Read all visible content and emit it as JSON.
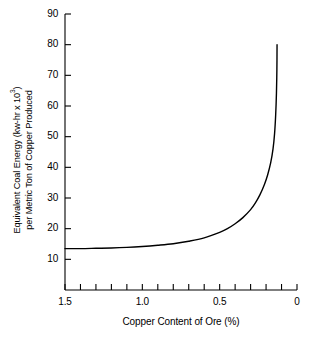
{
  "chart_data": {
    "type": "line",
    "title": "",
    "xlabel": "Copper Content of Ore (%)",
    "ylabel_line1": "Equivalent Coal Energy (kw-hr x 10",
    "ylabel_sup": "3",
    "ylabel_line1_end": ")",
    "ylabel_line2": "per Metric Ton of Copper Produced",
    "xlim": [
      1.5,
      0.0
    ],
    "ylim": [
      0,
      90
    ],
    "x_axis_reversed": true,
    "grid": false,
    "legend": null,
    "y_ticks": [
      90,
      80,
      70,
      60,
      50,
      40,
      30,
      20,
      10
    ],
    "y_tick_labels": [
      "90",
      "80",
      "70",
      "60",
      "50",
      "40",
      "30",
      "20",
      "10"
    ],
    "x_ticks_major": [
      1.5,
      1.0,
      0.5,
      0.0
    ],
    "x_tick_labels_major": [
      "1.5",
      "1.0",
      "0.5",
      "0"
    ],
    "x_ticks_minor": [
      1.4,
      1.3,
      1.2,
      1.1,
      0.9,
      0.8,
      0.7,
      0.6,
      0.4,
      0.3,
      0.2,
      0.1
    ],
    "line_color": "#000000",
    "line_width": 1.4,
    "x": [
      1.5,
      1.4,
      1.3,
      1.2,
      1.1,
      1.0,
      0.9,
      0.8,
      0.7,
      0.6,
      0.5,
      0.45,
      0.4,
      0.35,
      0.3,
      0.27,
      0.24,
      0.21,
      0.19,
      0.17,
      0.155,
      0.145,
      0.138,
      0.133,
      0.13,
      0.129
    ],
    "values": [
      13.5,
      13.5,
      13.6,
      13.7,
      13.9,
      14.2,
      14.6,
      15.1,
      15.9,
      17.0,
      18.8,
      20.0,
      21.6,
      23.6,
      26.2,
      28.3,
      31.0,
      34.5,
      37.5,
      41.5,
      46.0,
      51.0,
      57.0,
      64.0,
      72.0,
      80.0
    ]
  }
}
